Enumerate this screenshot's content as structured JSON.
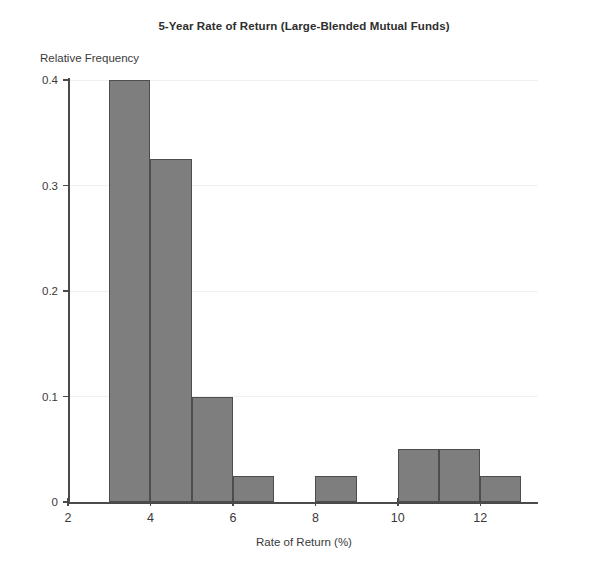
{
  "chart_data": {
    "type": "bar",
    "title": "5-Year Rate of Return (Large-Blended Mutual Funds)",
    "subtitle": "",
    "xlabel": "Rate of Return (%)",
    "ylabel": "Relative Frequency",
    "xlim": [
      2,
      13.4
    ],
    "ylim": [
      0,
      0.4
    ],
    "xticks": [
      2,
      4,
      6,
      8,
      10,
      12
    ],
    "xtick_labels": [
      "2",
      "4",
      "6",
      "8",
      "10",
      "12"
    ],
    "yticks": [
      0,
      0.1,
      0.2,
      0.3,
      0.4
    ],
    "ytick_labels": [
      "0",
      "0.1",
      "0.2",
      "0.3",
      "0.4"
    ],
    "grid": true,
    "grid_axis": "y",
    "legend": null,
    "bin_width": 1,
    "bin_edges": [
      3,
      4,
      5,
      6,
      7,
      8,
      9,
      10,
      11,
      12,
      13
    ],
    "categories": [
      "3-4",
      "4-5",
      "5-6",
      "6-7",
      "7-8",
      "8-9",
      "9-10",
      "10-11",
      "11-12",
      "12-13"
    ],
    "values": [
      0.4,
      0.325,
      0.1,
      0.025,
      0.0,
      0.025,
      0.0,
      0.05,
      0.05,
      0.025
    ],
    "bars": [
      {
        "x0": 3,
        "x1": 4,
        "value": 0.4
      },
      {
        "x0": 4,
        "x1": 5,
        "value": 0.325
      },
      {
        "x0": 5,
        "x1": 6,
        "value": 0.1
      },
      {
        "x0": 6,
        "x1": 7,
        "value": 0.025
      },
      {
        "x0": 8,
        "x1": 9,
        "value": 0.025
      },
      {
        "x0": 10,
        "x1": 11,
        "value": 0.05
      },
      {
        "x0": 11,
        "x1": 12,
        "value": 0.05
      },
      {
        "x0": 12,
        "x1": 13,
        "value": 0.025
      }
    ],
    "colors": {
      "bar_fill": "#7e7e7e",
      "bar_edge": "#4d4d4d",
      "axis": "#4a4a4a",
      "grid": "#f0f0f0",
      "text": "#3a3a3a",
      "background": "#ffffff"
    }
  }
}
